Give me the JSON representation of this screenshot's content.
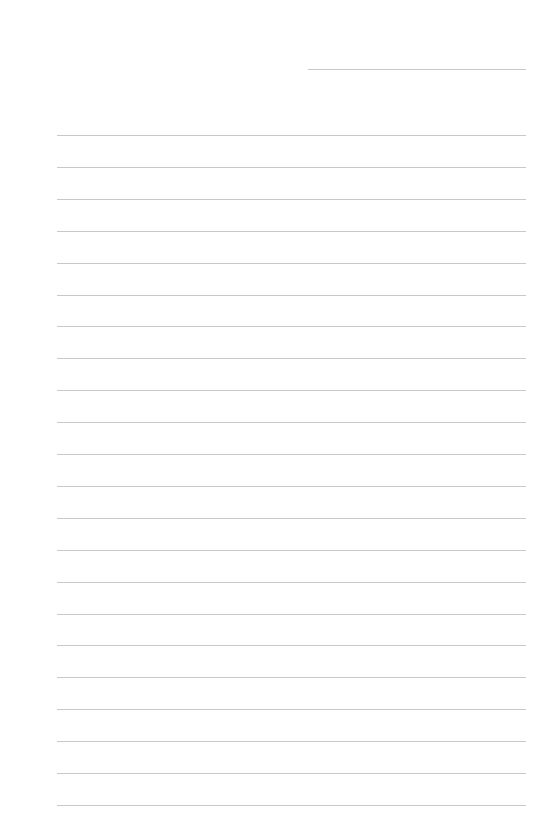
{
  "page": {
    "type": "lined-paper",
    "background_color": "#ffffff",
    "line_color": "#c8c8c8",
    "header_line": {
      "x": 308,
      "y": 69,
      "width": 218
    },
    "ruled_lines": {
      "count": 22,
      "start_y": 135,
      "spacing": 31.9,
      "x": 57,
      "width": 469
    }
  }
}
